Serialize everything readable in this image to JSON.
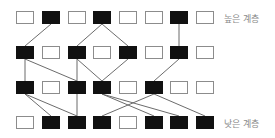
{
  "labels": {
    "top": "높은 계층",
    "bottom": "낮은 계층"
  },
  "colors": {
    "active": "#111111",
    "inactive_fill": "#ffffff",
    "inactive_border": "#8c8c8c",
    "edge": "#5a5a5a",
    "label": "#8a8a8a"
  },
  "grid": {
    "columns": 8,
    "col_left": [
      16,
      42,
      68,
      93,
      119,
      145,
      170,
      196
    ],
    "row_top": [
      11,
      46,
      81,
      116
    ],
    "box_width": 18,
    "box_height": 13
  },
  "layers": [
    {
      "name": "layer-1-top",
      "active": [
        0,
        1,
        0,
        1,
        0,
        0,
        1,
        0
      ]
    },
    {
      "name": "layer-2",
      "active": [
        1,
        0,
        1,
        0,
        1,
        0,
        1,
        0
      ]
    },
    {
      "name": "layer-3",
      "active": [
        1,
        0,
        1,
        1,
        0,
        1,
        0,
        0
      ]
    },
    {
      "name": "layer-4-bottom",
      "active": [
        0,
        1,
        1,
        1,
        0,
        1,
        1,
        1
      ]
    }
  ],
  "edges": [
    {
      "from": [
        0,
        1
      ],
      "to": [
        1,
        0
      ]
    },
    {
      "from": [
        0,
        3
      ],
      "to": [
        1,
        2
      ]
    },
    {
      "from": [
        0,
        3
      ],
      "to": [
        1,
        4
      ]
    },
    {
      "from": [
        0,
        6
      ],
      "to": [
        1,
        6
      ]
    },
    {
      "from": [
        1,
        0
      ],
      "to": [
        2,
        0
      ]
    },
    {
      "from": [
        1,
        0
      ],
      "to": [
        2,
        2
      ]
    },
    {
      "from": [
        1,
        2
      ],
      "to": [
        2,
        2
      ]
    },
    {
      "from": [
        1,
        2
      ],
      "to": [
        2,
        3
      ]
    },
    {
      "from": [
        1,
        4
      ],
      "to": [
        2,
        3
      ]
    },
    {
      "from": [
        1,
        6
      ],
      "to": [
        2,
        5
      ]
    },
    {
      "from": [
        2,
        0
      ],
      "to": [
        3,
        1
      ]
    },
    {
      "from": [
        2,
        0
      ],
      "to": [
        3,
        2
      ]
    },
    {
      "from": [
        2,
        2
      ],
      "to": [
        3,
        2
      ]
    },
    {
      "from": [
        2,
        3
      ],
      "to": [
        3,
        5
      ]
    },
    {
      "from": [
        2,
        3
      ],
      "to": [
        3,
        6
      ]
    },
    {
      "from": [
        2,
        5
      ],
      "to": [
        3,
        3
      ]
    },
    {
      "from": [
        2,
        5
      ],
      "to": [
        3,
        7
      ]
    }
  ]
}
